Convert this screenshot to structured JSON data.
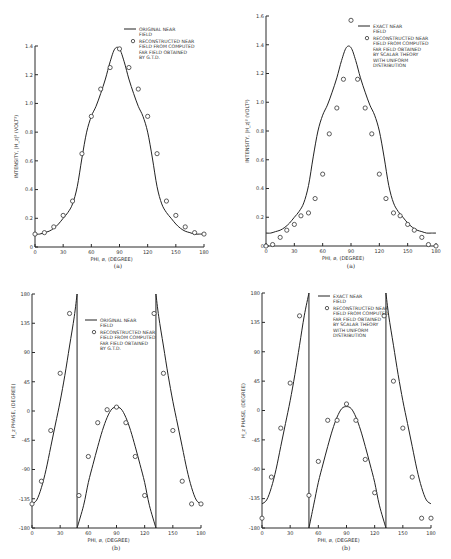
{
  "chart_data": [
    {
      "id": "tl",
      "type": "line",
      "panel_label": "(a)",
      "xlabel": "PHI, ø, (DEGREE)",
      "ylabel": "INTENSITY, |H_z|² (VOLT²)",
      "xlim": [
        0,
        180
      ],
      "ylim": [
        0,
        1.4
      ],
      "xticks": [
        0,
        30,
        60,
        90,
        120,
        150,
        180
      ],
      "yticks": [
        0,
        0.2,
        0.4,
        0.6,
        0.8,
        1.0,
        1.2,
        1.4
      ],
      "ytick_labels": [
        "0",
        "0.2",
        "0.4",
        "0.6",
        "0.8",
        "1.0",
        "1.2",
        "1.4"
      ],
      "grid": false,
      "legend": [
        "ORIGINAL NEAR FIELD",
        "RECONSTRUCTED NEAR FIELD FROM COMPUTED FAR FIELD OBTAINED BY G.T.D."
      ],
      "series": [
        {
          "name": "ORIGINAL NEAR FIELD",
          "style": "line",
          "x": [
            0,
            5,
            10,
            15,
            20,
            25,
            30,
            35,
            40,
            45,
            50,
            55,
            60,
            65,
            70,
            75,
            80,
            85,
            90,
            95,
            100,
            105,
            110,
            115,
            120,
            125,
            130,
            135,
            140,
            145,
            150,
            155,
            160,
            165,
            170,
            175,
            180
          ],
          "y": [
            0.09,
            0.09,
            0.1,
            0.11,
            0.13,
            0.16,
            0.2,
            0.24,
            0.3,
            0.42,
            0.62,
            0.8,
            0.91,
            0.98,
            1.07,
            1.17,
            1.29,
            1.38,
            1.38,
            1.29,
            1.17,
            1.07,
            0.98,
            0.91,
            0.8,
            0.62,
            0.42,
            0.3,
            0.24,
            0.2,
            0.16,
            0.13,
            0.11,
            0.1,
            0.09,
            0.09,
            0.09
          ]
        },
        {
          "name": "RECONSTRUCTED NEAR FIELD FROM COMPUTED FAR FIELD OBTAINED BY G.T.D.",
          "style": "marker",
          "x": [
            0,
            10,
            20,
            30,
            40,
            50,
            60,
            70,
            80,
            90,
            100,
            110,
            120,
            130,
            140,
            150,
            160,
            170,
            180
          ],
          "y": [
            0.09,
            0.1,
            0.14,
            0.22,
            0.32,
            0.65,
            0.91,
            1.1,
            1.25,
            1.38,
            1.25,
            1.1,
            0.91,
            0.65,
            0.32,
            0.22,
            0.14,
            0.1,
            0.09
          ]
        }
      ]
    },
    {
      "id": "tr",
      "type": "line",
      "panel_label": "(a)",
      "xlabel": "PHI, ø, (DEGREE)",
      "ylabel": "INTENSITY, |H_z|² (VOLT²)",
      "xlim": [
        0,
        180
      ],
      "ylim": [
        0,
        1.6
      ],
      "xticks": [
        0,
        30,
        60,
        90,
        120,
        150,
        180
      ],
      "yticks": [
        0,
        0.2,
        0.4,
        0.6,
        0.8,
        1.0,
        1.2,
        1.4,
        1.6
      ],
      "ytick_labels": [
        "0",
        "0.2",
        "0.4",
        "0.6",
        "0.8",
        "1.0",
        "1.2",
        "1.4",
        "1.6"
      ],
      "grid": false,
      "legend": [
        "EXACT NEAR FIELD",
        "RECONSTRUCTED NEAR FIELD FROM COMPUTED FAR FIELD OBTAINED BY SCALAR THEORY WITH UNIFORM DISTRIBUTION"
      ],
      "series": [
        {
          "name": "EXACT NEAR FIELD",
          "style": "line",
          "x": [
            0,
            5,
            10,
            15,
            20,
            25,
            30,
            35,
            40,
            45,
            50,
            55,
            60,
            65,
            70,
            75,
            80,
            85,
            90,
            95,
            100,
            105,
            110,
            115,
            120,
            125,
            130,
            135,
            140,
            145,
            150,
            155,
            160,
            165,
            170,
            175,
            180
          ],
          "y": [
            0.09,
            0.09,
            0.1,
            0.11,
            0.13,
            0.16,
            0.2,
            0.24,
            0.3,
            0.42,
            0.62,
            0.8,
            0.91,
            0.98,
            1.07,
            1.17,
            1.29,
            1.38,
            1.38,
            1.29,
            1.17,
            1.07,
            0.98,
            0.91,
            0.8,
            0.62,
            0.42,
            0.3,
            0.24,
            0.2,
            0.16,
            0.13,
            0.11,
            0.1,
            0.09,
            0.09,
            0.09
          ]
        },
        {
          "name": "RECONSTRUCTED NEAR FIELD FROM COMPUTED FAR FIELD OBTAINED BY SCALAR THEORY WITH UNIFORM DISTRIBUTION",
          "style": "marker",
          "x": [
            0,
            7,
            15,
            22,
            30,
            37,
            45,
            52,
            60,
            67,
            75,
            82,
            90,
            97,
            105,
            112,
            120,
            127,
            135,
            142,
            150,
            157,
            165,
            172,
            180
          ],
          "y": [
            0.0,
            0.01,
            0.06,
            0.11,
            0.15,
            0.21,
            0.23,
            0.33,
            0.5,
            0.78,
            0.96,
            1.16,
            1.57,
            1.16,
            0.96,
            0.78,
            0.5,
            0.33,
            0.23,
            0.21,
            0.15,
            0.11,
            0.06,
            0.01,
            0.0
          ]
        }
      ]
    },
    {
      "id": "bl",
      "type": "line",
      "panel_label": "(b)",
      "xlabel": "PHI, ø, (DEGREE)",
      "ylabel": "H_z PHASE, (DEGREE)",
      "xlim": [
        0,
        180
      ],
      "ylim": [
        -180,
        180
      ],
      "xticks": [
        0,
        30,
        60,
        90,
        120,
        150,
        180
      ],
      "yticks": [
        -180,
        -135,
        -90,
        -45,
        0,
        45,
        90,
        135,
        180
      ],
      "ytick_labels": [
        "-180",
        "-135",
        "-90",
        "-45",
        "0",
        "45",
        "90",
        "135",
        "180"
      ],
      "grid": false,
      "legend": [
        "ORIGINAL NEAR FIELD",
        "RECONSTRUCTED NEAR FIELD FROM COMPUTED FAR FIELD OBTAINED BY G.T.D."
      ],
      "series": [
        {
          "name": "ORIGINAL NEAR FIELD",
          "style": "line",
          "segments": [
            {
              "x": [
                0,
                5,
                10,
                15,
                20,
                25,
                30,
                35,
                40,
                45,
                48
              ],
              "y": [
                -143,
                -137,
                -118,
                -90,
                -55,
                -20,
                15,
                55,
                100,
                145,
                180
              ]
            },
            {
              "x": [
                48,
                48
              ],
              "y": [
                180,
                -180
              ]
            },
            {
              "x": [
                48,
                55,
                60,
                65,
                70,
                75,
                80,
                85,
                90,
                95,
                100,
                105,
                110,
                115,
                120,
                125,
                132
              ],
              "y": [
                -180,
                -145,
                -110,
                -82,
                -55,
                -30,
                -10,
                3,
                6,
                3,
                -10,
                -30,
                -55,
                -82,
                -110,
                -145,
                -180
              ]
            },
            {
              "x": [
                132,
                132
              ],
              "y": [
                -180,
                180
              ]
            },
            {
              "x": [
                132,
                135,
                140,
                145,
                150,
                155,
                160,
                165,
                170,
                175,
                180
              ],
              "y": [
                180,
                145,
                100,
                55,
                15,
                -20,
                -55,
                -90,
                -118,
                -137,
                -143
              ]
            }
          ]
        },
        {
          "name": "RECONSTRUCTED NEAR FIELD FROM COMPUTED FAR FIELD OBTAINED BY G.T.D.",
          "style": "marker",
          "x": [
            0,
            10,
            20,
            30,
            40,
            50,
            60,
            70,
            80,
            90,
            100,
            110,
            120,
            130,
            140,
            150,
            160,
            170,
            180
          ],
          "y": [
            -143,
            -108,
            -30,
            58,
            150,
            -130,
            -70,
            -18,
            2,
            6,
            -18,
            -70,
            -130,
            150,
            58,
            -30,
            -108,
            -143,
            -143
          ]
        }
      ]
    },
    {
      "id": "br",
      "type": "line",
      "panel_label": "(b)",
      "xlabel": "PHI, ø, (DEGREE)",
      "ylabel": "H_z PHASE, (DEGREE)",
      "xlim": [
        0,
        180
      ],
      "ylim": [
        -180,
        180
      ],
      "xticks": [
        0,
        30,
        60,
        90,
        120,
        150,
        180
      ],
      "yticks": [
        -180,
        -135,
        -90,
        -45,
        0,
        45,
        90,
        135,
        180
      ],
      "ytick_labels": [
        "-180",
        "-135",
        "-90",
        "-45",
        "0",
        "45",
        "90",
        "135",
        "180"
      ],
      "grid": false,
      "legend": [
        "EXACT NEAR FIELD",
        "RECONSTRUCTED NEAR FIELD FROM COMPUTED FAR FIELD OBTAINED BY SCALAR THEORY WITH UNIFORM DISTRIBUTION"
      ],
      "series": [
        {
          "name": "EXACT NEAR FIELD",
          "style": "line",
          "segments": [
            {
              "x": [
                0,
                5,
                10,
                15,
                20,
                25,
                30,
                35,
                40,
                45,
                50
              ],
              "y": [
                -143,
                -137,
                -118,
                -90,
                -55,
                -20,
                15,
                55,
                100,
                145,
                180
              ]
            },
            {
              "x": [
                50,
                50
              ],
              "y": [
                180,
                -180
              ]
            },
            {
              "x": [
                50,
                55,
                60,
                65,
                70,
                75,
                80,
                85,
                90,
                95,
                100,
                105,
                110,
                115,
                120,
                125,
                132
              ],
              "y": [
                -180,
                -145,
                -110,
                -82,
                -55,
                -30,
                -10,
                3,
                6,
                3,
                -10,
                -30,
                -55,
                -82,
                -110,
                -145,
                -180
              ]
            },
            {
              "x": [
                132,
                132
              ],
              "y": [
                -180,
                180
              ]
            },
            {
              "x": [
                132,
                135,
                140,
                145,
                150,
                155,
                160,
                165,
                170,
                175,
                180
              ],
              "y": [
                180,
                145,
                100,
                55,
                15,
                -20,
                -55,
                -90,
                -118,
                -137,
                -143
              ]
            }
          ]
        },
        {
          "name": "RECONSTRUCTED NEAR FIELD FROM COMPUTED FAR FIELD OBTAINED BY SCALAR THEORY WITH UNIFORM DISTRIBUTION",
          "style": "marker",
          "x": [
            0,
            10,
            20,
            30,
            40,
            50,
            60,
            70,
            80,
            90,
            100,
            110,
            120,
            130,
            140,
            150,
            160,
            170,
            180
          ],
          "y": [
            -165,
            -102,
            -27,
            42,
            145,
            -130,
            -78,
            -15,
            -15,
            10,
            -15,
            -75,
            -126,
            145,
            45,
            -27,
            -102,
            -165,
            -165
          ]
        }
      ]
    }
  ],
  "layout": {
    "tl": {
      "x0": 35,
      "x1": 204,
      "y0": 247,
      "y1": 46,
      "legend_x": 124,
      "legend_y": 29,
      "label_x": 118,
      "label_y": 268
    },
    "tr": {
      "x0": 266,
      "x1": 436,
      "y0": 246,
      "y1": 16,
      "legend_x": 358,
      "legend_y": 26,
      "label_x": 351,
      "label_y": 268
    },
    "bl": {
      "x0": 32,
      "x1": 201,
      "y0": 528,
      "y1": 294,
      "legend_x": 85,
      "legend_y": 320,
      "label_x": 116,
      "label_y": 550
    },
    "br": {
      "x0": 262,
      "x1": 431,
      "y0": 528,
      "y1": 293,
      "legend_x": 318,
      "legend_y": 296,
      "label_x": 346,
      "label_y": 550
    }
  }
}
